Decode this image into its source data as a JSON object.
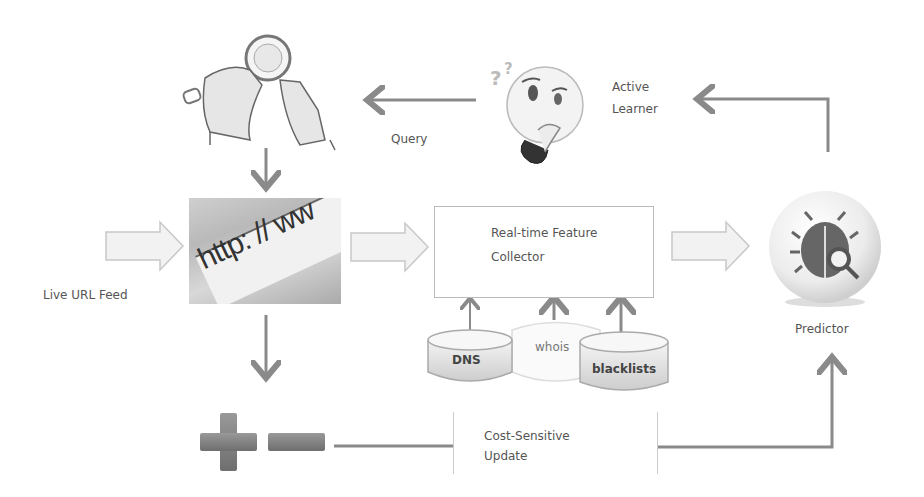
{
  "diagram": {
    "nodes": {
      "manual_labeler": {
        "icon": "magnifier-hands-icon"
      },
      "active_learner": {
        "icon": "thinking-face-icon",
        "label_line1": "Active",
        "label_line2": "Learner"
      },
      "url_feed": {
        "icon": "browser-url-bar-icon",
        "url_text": "http: // ww",
        "label": "Live URL Feed"
      },
      "collector": {
        "label_line1": "Real-time Feature",
        "label_line2": "Collector"
      },
      "sources": [
        {
          "label": "DNS"
        },
        {
          "label": "whois"
        },
        {
          "label": "blacklists"
        }
      ],
      "predictor": {
        "icon": "bug-search-icon",
        "label": "Predictor"
      },
      "labels_signs": {
        "plus": "plus-icon",
        "minus": "minus-icon"
      },
      "update": {
        "label_line1": "Cost-Sensitive",
        "label_line2": "Update"
      }
    },
    "edges": {
      "query_label": "Query"
    },
    "colors": {
      "arrow": "#8a8a8a",
      "block_arrow_fill": "#f2f2f2",
      "block_arrow_stroke": "#c8c8c8",
      "cylinder": "#d9d9d9",
      "plus_minus": "#7d7d7d"
    }
  }
}
